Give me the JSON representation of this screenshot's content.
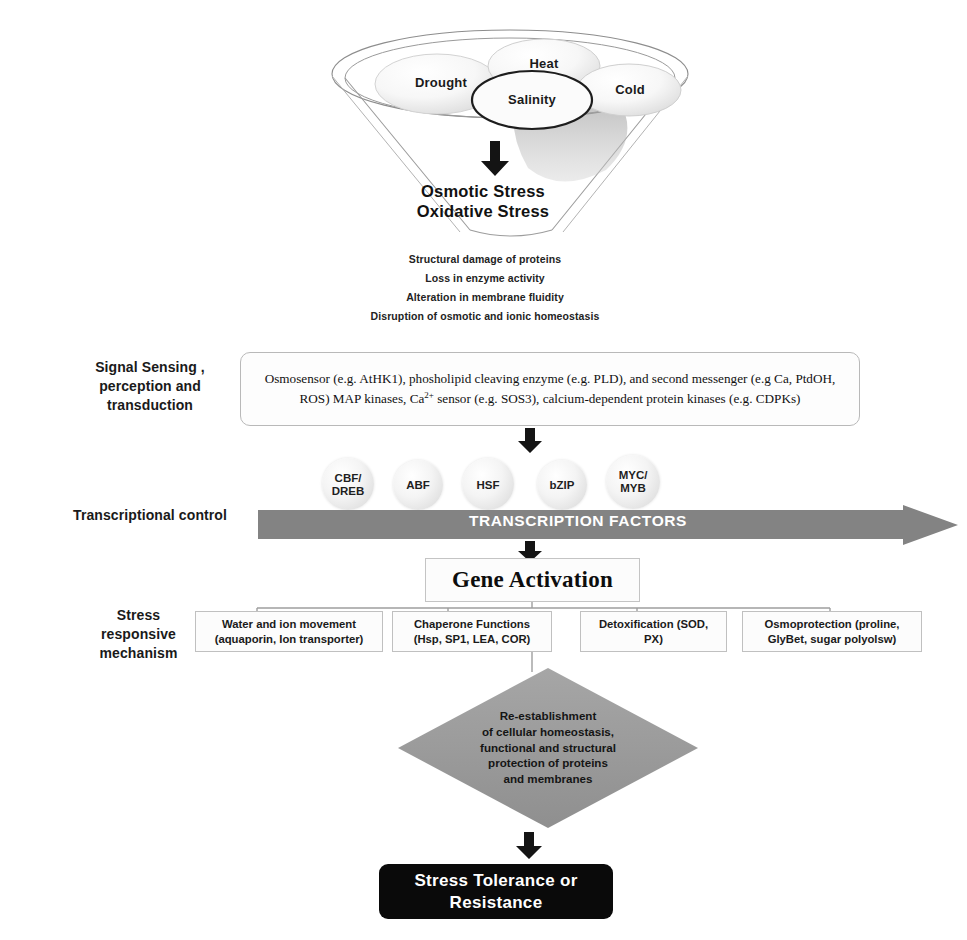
{
  "funnel": {
    "stressors": [
      {
        "name": "drought",
        "label": "Drought"
      },
      {
        "name": "heat",
        "label": "Heat"
      },
      {
        "name": "salinity",
        "label": "Salinity"
      },
      {
        "name": "cold",
        "label": "Cold"
      }
    ],
    "outputs": [
      "Osmotic Stress",
      "Oxidative Stress"
    ],
    "consequences": [
      "Structural damage of proteins",
      "Loss in enzyme activity",
      "Alteration in membrane fluidity",
      "Disruption of osmotic and ionic homeostasis"
    ]
  },
  "stages": {
    "signal": "Signal Sensing ,\nperception and\ntransduction",
    "transcription": "Transcriptional control",
    "mechanism": "Stress\nresponsive\nmechanism"
  },
  "signal_box": {
    "line1_a": "Osmosensor (e.g. AtHK1), phosholipid cleaving enzyme (e.g. PLD), and second messenger (e.g Ca,",
    "line2_a": "PtdOH, ROS) MAP kinases, Ca",
    "line2_sup": "2+",
    "line2_b": " sensor (e.g. SOS3), calcium-dependent protein kinases (e.g.",
    "line3": "CDPKs)"
  },
  "transcription": {
    "factors": [
      {
        "name": "cbf-dreb",
        "label": "CBF/\nDREB"
      },
      {
        "name": "abf",
        "label": "ABF"
      },
      {
        "name": "hsf",
        "label": "HSF"
      },
      {
        "name": "bzip",
        "label": "bZIP"
      },
      {
        "name": "myc-myb",
        "label": "MYC/\nMYB"
      }
    ],
    "arrow_label": "TRANSCRIPTION FACTORS"
  },
  "gene_activation": {
    "label": "Gene Activation"
  },
  "mechanisms": [
    {
      "name": "water-ion-movement",
      "label": "Water and ion movement\n(aquaporin, Ion transporter)"
    },
    {
      "name": "chaperone-functions",
      "label": "Chaperone  Functions\n(Hsp, SP1, LEA, COR)"
    },
    {
      "name": "detoxification",
      "label": "Detoxification  (SOD,\nPX)"
    },
    {
      "name": "osmoprotection",
      "label": "Osmoprotection (proline,\nGlyBet, sugar polyolsw)"
    }
  ],
  "outcome": {
    "label": "Re-establishment\nof cellular  homeostasis,\nfunctional and structural\nprotection of proteins\nand membranes"
  },
  "final": {
    "label": "Stress Tolerance or\nResistance"
  },
  "colors": {
    "arrow_grey": "#808080",
    "diamond_grey": "#9a9a9a",
    "final_black": "#0a0a0a",
    "box_border": "#c0c0c0",
    "text_dark": "#1a1a1a"
  }
}
